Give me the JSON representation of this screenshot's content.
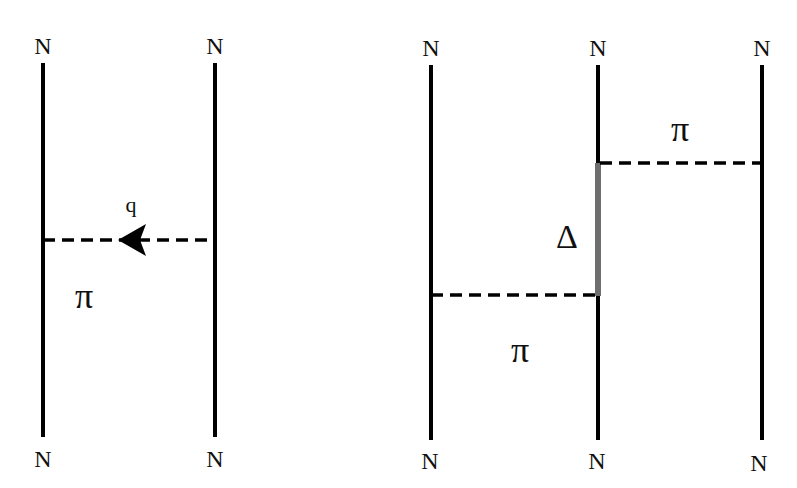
{
  "diagram": {
    "colors": {
      "line": "#000000",
      "delta_line": "#6e6e6e",
      "background": "#ffffff"
    },
    "left": {
      "nucleons": [
        {
          "top_label": "N",
          "bottom_label": "N"
        },
        {
          "top_label": "N",
          "bottom_label": "N"
        }
      ],
      "exchange": {
        "particle": "π",
        "momentum_label": "q",
        "arrow": "left"
      }
    },
    "right": {
      "nucleons": [
        {
          "top_label": "N",
          "bottom_label": "N"
        },
        {
          "top_label": "N",
          "bottom_label": "N"
        },
        {
          "top_label": "N",
          "bottom_label": "N"
        }
      ],
      "exchanges": [
        {
          "particle": "π",
          "between": "nucleon-2 and nucleon-3",
          "position": "upper"
        },
        {
          "particle": "π",
          "between": "nucleon-1 and nucleon-2",
          "position": "lower"
        }
      ],
      "intermediate": {
        "label": "Δ",
        "on": "nucleon-2"
      }
    }
  }
}
